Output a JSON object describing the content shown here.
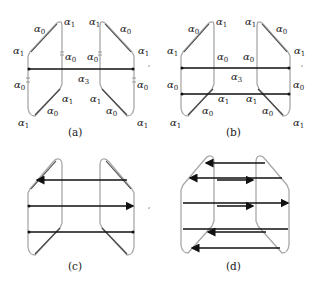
{
  "figure": {
    "panels": [
      {
        "id": "a",
        "caption": "(a)",
        "labels": {
          "left_top": "α",
          "left_top_sub": "1",
          "left_diag": "α",
          "left_diag_sub": "0",
          "left_mid_upper": "α",
          "left_mid_upper_sub": "1",
          "left_inner": "α",
          "left_inner_sub": "0",
          "left_mid_lower": "α",
          "left_mid_lower_sub": "0",
          "left_lower_inner": "α",
          "left_lower_inner_sub": "1",
          "left_lower_diag": "α",
          "left_lower_diag_sub": "0",
          "left_bottom": "α",
          "left_bottom_sub": "1",
          "center": "α",
          "center_sub": "3",
          "right_top": "α",
          "right_top_sub": "1",
          "right_diag": "α",
          "right_diag_sub": "0",
          "right_mid_upper": "α",
          "right_mid_upper_sub": "1",
          "right_inner": "α",
          "right_inner_sub": "0",
          "right_mid_lower": "α",
          "right_mid_lower_sub": "0",
          "right_lower_inner": "α",
          "right_lower_inner_sub": "1",
          "right_lower_diag": "α",
          "right_lower_diag_sub": "0",
          "right_bottom": "α",
          "right_bottom_sub": "1"
        },
        "black_edges": 1
      },
      {
        "id": "b",
        "caption": "(b)",
        "black_edges": 2
      },
      {
        "id": "c",
        "caption": "(c)",
        "black_edges": 3
      },
      {
        "id": "d",
        "caption": "(d)",
        "black_edges": 7
      }
    ],
    "stray_mark": ","
  }
}
